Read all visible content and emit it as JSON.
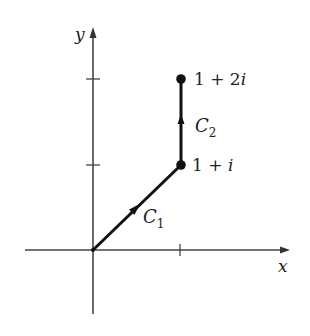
{
  "diagram": {
    "type": "complex-plane-contour",
    "axes": {
      "x_label": "x",
      "y_label": "y",
      "x_ticks": [
        1
      ],
      "y_ticks": [
        1,
        2
      ]
    },
    "points": [
      {
        "id": "origin",
        "value": "0",
        "label": ""
      },
      {
        "id": "p1",
        "value": "1+i",
        "label_parts": [
          "1 + ",
          "i"
        ]
      },
      {
        "id": "p2",
        "value": "1+2i",
        "label_parts": [
          "1 + 2",
          "i"
        ]
      }
    ],
    "curves": [
      {
        "id": "C1",
        "name": "C",
        "subscript": "1",
        "from": "0",
        "to": "1+i",
        "direction": "toward 1+i"
      },
      {
        "id": "C2",
        "name": "C",
        "subscript": "2",
        "from": "1+i",
        "to": "1+2i",
        "direction": "upward"
      }
    ],
    "colors": {
      "axis": "#444444",
      "path": "#111111",
      "text": "#222222"
    }
  }
}
